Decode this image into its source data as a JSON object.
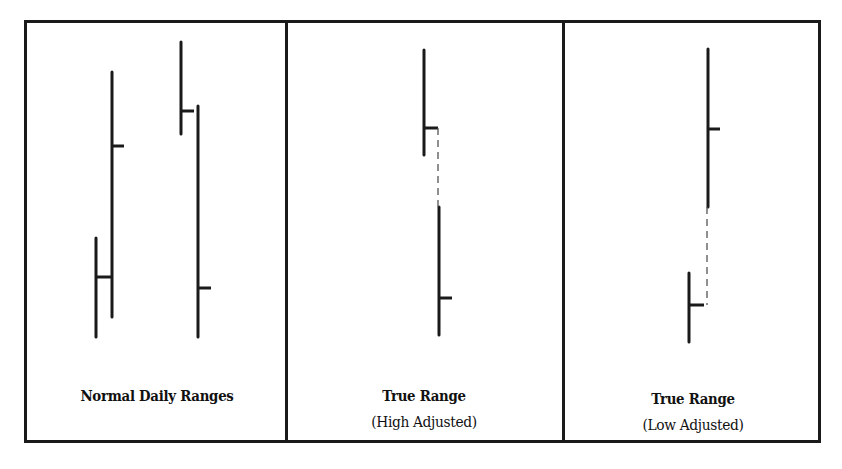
{
  "figure": {
    "frame": {
      "x": 24,
      "y": 20,
      "width": 797,
      "height": 423
    },
    "dividers": [
      286,
      563
    ],
    "line_color": "#1a1a1a",
    "dash_color": "#555555"
  },
  "panels": [
    {
      "id": "normal",
      "title_line1": "Normal Daily Ranges",
      "title_line2": "",
      "label_center_x": 157,
      "label_top": 382,
      "bars": [
        {
          "x": 96,
          "high": 238,
          "low": 337,
          "close": 277,
          "tick_len": 15
        },
        {
          "x": 112,
          "high": 72,
          "low": 317,
          "close": 146,
          "tick_len": 12
        },
        {
          "x": 181,
          "high": 42,
          "low": 134,
          "close": 111,
          "tick_len": 13
        },
        {
          "x": 198,
          "high": 106,
          "low": 337,
          "close": 288,
          "tick_len": 13
        }
      ],
      "dashes": []
    },
    {
      "id": "high-adjusted",
      "title_line1": "True Range",
      "title_line2": "(High Adjusted)",
      "label_center_x": 424,
      "label_top": 382,
      "bars": [
        {
          "x": 424,
          "high": 50,
          "low": 155,
          "close": 128,
          "tick_len": 14
        },
        {
          "x": 439,
          "high": 207,
          "low": 335,
          "close": 298,
          "tick_len": 13
        }
      ],
      "dashes": [
        {
          "x": 438,
          "y1": 128,
          "y2": 207
        }
      ]
    },
    {
      "id": "low-adjusted",
      "title_line1": "True Range",
      "title_line2": "(Low Adjusted)",
      "label_center_x": 693,
      "label_top": 385,
      "bars": [
        {
          "x": 708,
          "high": 49,
          "low": 207,
          "close": 129,
          "tick_len": 12
        },
        {
          "x": 689,
          "high": 273,
          "low": 342,
          "close": 305,
          "tick_len": 15
        }
      ],
      "dashes": [
        {
          "x": 707,
          "y1": 207,
          "y2": 305
        }
      ]
    }
  ],
  "chart_data": {
    "type": "bar",
    "subtype": "high-low-close bar diagram",
    "title": "",
    "panels": [
      {
        "label": "Normal Daily Ranges",
        "bars": [
          {
            "high": 238,
            "low": 337,
            "close": 277
          },
          {
            "high": 72,
            "low": 317,
            "close": 146
          },
          {
            "high": 42,
            "low": 134,
            "close": 111
          },
          {
            "high": 106,
            "low": 337,
            "close": 288
          }
        ]
      },
      {
        "label": "True Range (High Adjusted)",
        "bars": [
          {
            "high": 50,
            "low": 155,
            "close": 128
          },
          {
            "high": 207,
            "low": 335,
            "close": 298
          }
        ],
        "adjustment": "dashed extension from previous close down to current high"
      },
      {
        "label": "True Range (Low Adjusted)",
        "bars": [
          {
            "high": 49,
            "low": 207,
            "close": 129
          },
          {
            "high": 273,
            "low": 342,
            "close": 305
          }
        ],
        "adjustment": "dashed extension from previous close up to current low"
      }
    ],
    "note": "values are pixel y-positions (smaller = higher price); no axes shown",
    "xlabel": "",
    "ylabel": ""
  }
}
